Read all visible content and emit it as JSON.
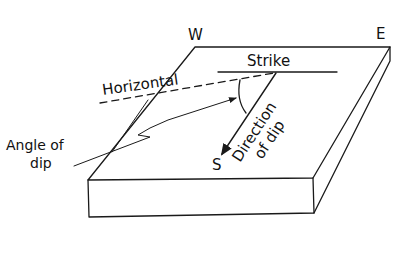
{
  "diagram": {
    "compass": {
      "west": "W",
      "east": "E",
      "south": "S"
    },
    "labels": {
      "strike": "Strike",
      "horizontal": "Horizontal",
      "angle_of_dip_line1": "Angle of",
      "angle_of_dip_line2": "dip",
      "direction_of_dip_line1": "Direction",
      "direction_of_dip_line2": "of dip"
    },
    "colors": {
      "ink": "#1a1a1a",
      "background": "#ffffff"
    }
  }
}
